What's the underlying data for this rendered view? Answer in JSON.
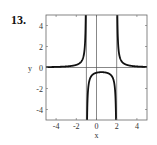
{
  "problem": {
    "number": "13."
  },
  "chart_data": {
    "type": "line",
    "title": "",
    "xlabel": "x",
    "ylabel": "y",
    "xlim": [
      -5,
      5
    ],
    "ylim": [
      -5,
      5
    ],
    "xticks": [
      -4,
      -2,
      0,
      2,
      4
    ],
    "yticks": [
      -4,
      -2,
      0,
      2,
      4
    ],
    "xtick_labels": [
      "-4",
      "-2",
      "0",
      "2",
      "4"
    ],
    "ytick_labels": [
      "-4",
      "-2",
      "0",
      "2",
      "4"
    ],
    "grid": false,
    "legend": null,
    "vertical_asymptotes": [
      -1,
      2
    ],
    "horizontal_asymptote": 0,
    "function": "y = 1/((x+1)(x-2))",
    "series": [
      {
        "name": "left branch",
        "x": [
          -5,
          -4,
          -3,
          -2,
          -1.5,
          -1.2,
          -1.1
        ],
        "y": [
          0.036,
          0.056,
          0.1,
          0.25,
          0.571,
          1.563,
          3.226
        ]
      },
      {
        "name": "middle branch",
        "x": [
          -0.9,
          -0.8,
          -0.5,
          0,
          0.5,
          1,
          1.5,
          1.8,
          1.9
        ],
        "y": [
          -3.448,
          -1.786,
          -0.8,
          -0.5,
          -0.444,
          -0.5,
          -0.8,
          -1.786,
          -3.448
        ]
      },
      {
        "name": "right branch",
        "x": [
          2.1,
          2.2,
          2.5,
          3,
          4,
          5
        ],
        "y": [
          3.226,
          1.563,
          0.571,
          0.25,
          0.1,
          0.056
        ]
      }
    ],
    "colors": {
      "curve": "#111111",
      "axes": "#555555",
      "frame": "#666666"
    }
  }
}
